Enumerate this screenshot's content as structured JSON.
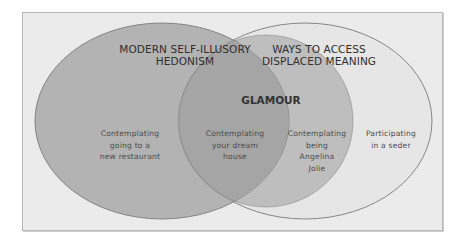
{
  "diagram": {
    "type": "venn",
    "sets": [
      {
        "id": "left",
        "label_lines": [
          "MODERN SELF-ILLUSORY",
          "HEDONISM"
        ],
        "fill": "#b3b3b3"
      },
      {
        "id": "right",
        "label_lines": [
          "WAYS TO ACCESS",
          "DISPLACED MEANING"
        ],
        "fill": "#e6e6e6"
      },
      {
        "id": "inner",
        "label_lines": [
          "GLAMOUR"
        ],
        "fill": "#bebebe"
      }
    ],
    "regions": [
      {
        "id": "left-only",
        "lines": [
          "Contemplating",
          "going to a",
          "new restaurant"
        ]
      },
      {
        "id": "left-and-glamour",
        "lines": [
          "Contemplating",
          "your dream",
          "house"
        ]
      },
      {
        "id": "glamour-only",
        "lines": [
          "Contemplating",
          "being",
          "Angelina",
          "Jolie"
        ]
      },
      {
        "id": "right-only",
        "lines": [
          "Participating",
          "in a seder"
        ]
      }
    ],
    "colors": {
      "frame_bg": "#ebebeb",
      "left_fill": "#b3b3b3",
      "overlap_fill": "#a5a5a5",
      "glamour_fill": "#bebebe",
      "right_fill": "#e6e6e6",
      "outline": "#7a7a7a"
    }
  }
}
